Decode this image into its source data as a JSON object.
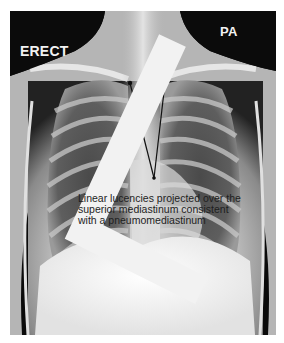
{
  "image": {
    "description": "Frontal (PA) erect chest radiograph with annotated arrows pointing to superior mediastinum",
    "labels": {
      "position": "ERECT",
      "projection": "PA",
      "side_marker": "L"
    },
    "annotation": {
      "lines": [
        "Linear lucencies projected over the",
        "superior mediastinum consistent",
        "with a pneumomediastinum"
      ]
    },
    "arrows": [
      {
        "from": [
          154,
          178
        ],
        "to": [
          130,
          83
        ]
      },
      {
        "from": [
          154,
          178
        ],
        "to": [
          165,
          83
        ]
      }
    ]
  }
}
